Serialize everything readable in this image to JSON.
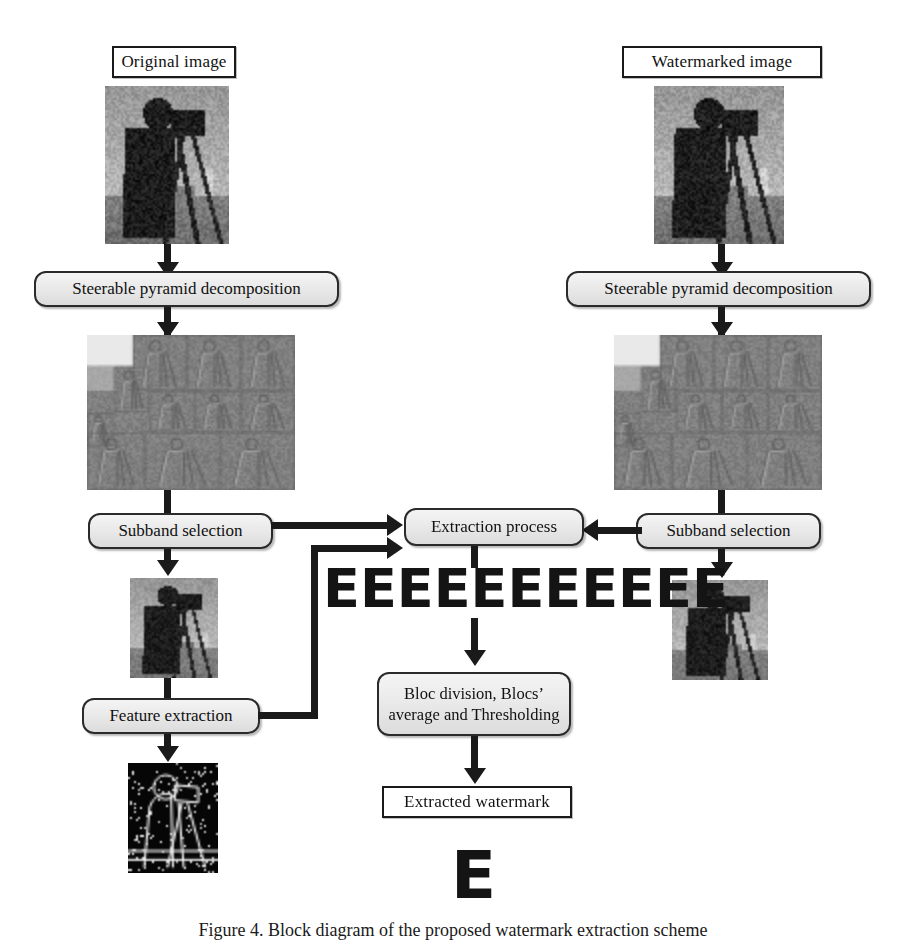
{
  "figure": {
    "caption": "Figure 4. Block diagram of the proposed watermark extraction scheme",
    "accent_color": "#1a1a1a",
    "box_fill_color": "#eaeaea",
    "box_border_color": "#2a2a2a",
    "page_background": "#ffffff"
  },
  "left_branch": {
    "title": "Original image",
    "source_image_alt": "cameraman-grayscale-photo",
    "decomposition_label": "Steerable pyramid decomposition",
    "pyramid_image_alt": "steerable-pyramid-subbands-grid",
    "subband_label": "Subband selection",
    "selected_subband_alt": "cameraman-selected-subband",
    "feature_label": "Feature extraction",
    "feature_image_alt": "cameraman-edge-map"
  },
  "right_branch": {
    "title": "Watermarked image",
    "source_image_alt": "watermarked-cameraman-grayscale-photo",
    "decomposition_label": "Steerable pyramid decomposition",
    "pyramid_image_alt": "steerable-pyramid-subbands-grid",
    "subband_label": "Subband selection",
    "selected_subband_alt": "watermarked-cameraman-selected-subband"
  },
  "center_branch": {
    "extraction_label": "Extraction process",
    "raw_watermark_sequence": "EEEEEEEEEEE",
    "raw_watermark_count": 11,
    "block_label_line1": "Bloc division, Blocs’",
    "block_label_line2": "average and Thresholding",
    "result_label": "Extracted watermark",
    "result_glyph": "E"
  }
}
